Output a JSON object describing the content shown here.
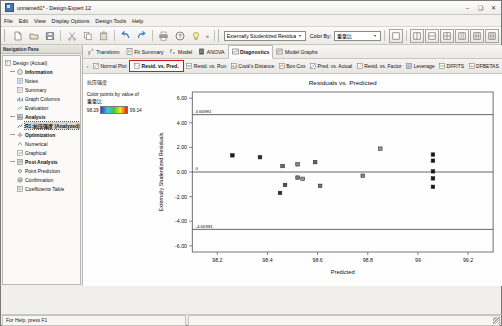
{
  "window": {
    "title": "unnamed1* - Design-Expert 12",
    "app_icon": "design-expert-icon",
    "minimize": "–",
    "maximize": "❑",
    "close": "✕"
  },
  "menubar": {
    "items": [
      {
        "label": "File"
      },
      {
        "label": "Edit"
      },
      {
        "label": "View"
      },
      {
        "label": "Display Options"
      },
      {
        "label": "Design Tools"
      },
      {
        "label": "Help"
      }
    ]
  },
  "toolbar": {
    "buttons": [
      {
        "name": "new-icon",
        "glyph": "⬜"
      },
      {
        "name": "open-icon",
        "glyph": "Ὄ1"
      },
      {
        "name": "save-icon",
        "glyph": "Ὃe"
      },
      {
        "name": "cut-icon",
        "glyph": "✂"
      },
      {
        "name": "copy-icon",
        "glyph": "⧉"
      },
      {
        "name": "paste-icon",
        "glyph": "Ὄb"
      },
      {
        "name": "undo-icon",
        "glyph": "↶"
      },
      {
        "name": "redo-icon",
        "glyph": "↷"
      },
      {
        "name": "print-icon",
        "glyph": "὚8"
      },
      {
        "name": "help-icon",
        "glyph": "?"
      },
      {
        "name": "tip-icon",
        "glyph": "Ὂ1"
      }
    ],
    "overflow": "»",
    "response_select": {
      "value": "Externally Studentized Residuals",
      "arrow": "▾"
    },
    "color_by_label": "Color By:",
    "color_by_select": {
      "value": "重量比",
      "arrow": "▾"
    },
    "view_buttons": [
      {
        "name": "view-single-icon"
      },
      {
        "name": "view-two-up-icon"
      },
      {
        "name": "view-three-up-icon"
      },
      {
        "name": "view-grid-icon"
      },
      {
        "name": "view-four-icon"
      },
      {
        "name": "view-six-icon"
      },
      {
        "name": "view-eight-icon"
      }
    ]
  },
  "navpane": {
    "header": "Navigation Pane",
    "tree": [
      {
        "level": 0,
        "label": "Design (Actual)",
        "icon": "table-icon",
        "bold": false,
        "selected": false
      },
      {
        "level": 1,
        "label": "Information",
        "icon": "info-icon",
        "bold": true,
        "selected": false
      },
      {
        "level": 2,
        "label": "Notes",
        "icon": "notes-icon",
        "bold": false,
        "selected": false
      },
      {
        "level": 2,
        "label": "Summary",
        "icon": "summary-icon",
        "bold": false,
        "selected": false
      },
      {
        "level": 2,
        "label": "Graph Columns",
        "icon": "graph-columns-icon",
        "bold": false,
        "selected": false
      },
      {
        "level": 2,
        "label": "Evaluation",
        "icon": "evaluation-icon",
        "bold": false,
        "selected": false
      },
      {
        "level": 1,
        "label": "Analysis",
        "icon": "analysis-icon",
        "bold": true,
        "selected": false
      },
      {
        "level": 2,
        "label": "R1:抗压强度 (Analyzed)",
        "icon": "response-icon",
        "bold": true,
        "selected": true
      },
      {
        "level": 1,
        "label": "Optimization",
        "icon": "optimization-icon",
        "bold": true,
        "selected": false
      },
      {
        "level": 2,
        "label": "Numerical",
        "icon": "numerical-icon",
        "bold": false,
        "selected": false
      },
      {
        "level": 2,
        "label": "Graphical",
        "icon": "graphical-icon",
        "bold": false,
        "selected": false
      },
      {
        "level": 1,
        "label": "Post Analysis",
        "icon": "post-analysis-icon",
        "bold": true,
        "selected": false
      },
      {
        "level": 2,
        "label": "Point Prediction",
        "icon": "point-prediction-icon",
        "bold": false,
        "selected": false
      },
      {
        "level": 2,
        "label": "Confirmation",
        "icon": "confirmation-icon",
        "bold": false,
        "selected": false
      },
      {
        "level": 2,
        "label": "Coefficients Table",
        "icon": "coefficients-icon",
        "bold": false,
        "selected": false
      }
    ]
  },
  "analysis": {
    "tabs": [
      {
        "label": "Transform",
        "icon": "transform-icon",
        "active": false
      },
      {
        "label": "Fit Summary",
        "icon": "fit-summary-icon",
        "active": false
      },
      {
        "label": "Model",
        "icon": "model-icon",
        "active": false
      },
      {
        "label": "ANOVA",
        "icon": "anova-icon",
        "active": false
      },
      {
        "label": "Diagnostics",
        "icon": "diagnostics-icon",
        "active": true
      },
      {
        "label": "Model Graphs",
        "icon": "model-graphs-icon",
        "active": false
      }
    ],
    "subtabs": [
      {
        "label": "Normal Plot",
        "icon": "normal-plot-icon",
        "highlight": false
      },
      {
        "label": "Resid. vs. Pred.",
        "icon": "resid-pred-icon",
        "highlight": true
      },
      {
        "label": "Resid. vs. Run",
        "icon": "resid-run-icon",
        "highlight": false
      },
      {
        "label": "Cook's Distance",
        "icon": "cooks-distance-icon",
        "highlight": false
      },
      {
        "label": "Box-Cox",
        "icon": "box-cox-icon",
        "highlight": false
      },
      {
        "label": "Pred. vs. Actual",
        "icon": "pred-actual-icon",
        "highlight": false
      },
      {
        "label": "Resid. vs. Factor",
        "icon": "resid-factor-icon",
        "highlight": false
      },
      {
        "label": "Leverage",
        "icon": "leverage-icon",
        "highlight": false
      },
      {
        "label": "DFFITS",
        "icon": "dffits-icon",
        "highlight": false
      },
      {
        "label": "DFBETAS",
        "icon": "dfbetas-icon",
        "highlight": false
      }
    ],
    "subtab_overflow": "»",
    "subtab_prev": "‹"
  },
  "legend": {
    "response_name": "抗压强度",
    "color_points_label": "Color points by value of",
    "color_by_name": "重量比",
    "min": "98.29",
    "max": "99.14"
  },
  "statusbar": {
    "help_text": "For Help, press F1"
  },
  "chart_data": {
    "type": "scatter",
    "title": "Residuals vs. Predicted",
    "xlabel": "Predicted",
    "ylabel": "Externally Studentized Residuals",
    "xlim": [
      98.1,
      99.3
    ],
    "ylim": [
      -6.5,
      6.5
    ],
    "xticks": [
      "98.2",
      "98.4",
      "98.6",
      "98.8",
      "99",
      "99.2"
    ],
    "xtickvals": [
      98.2,
      98.4,
      98.6,
      98.8,
      99.0,
      99.2
    ],
    "yticks": [
      "6.00",
      "4.00",
      "2.00",
      "0.00",
      "-2.00",
      "-4.00",
      "-6.00"
    ],
    "ytickvals": [
      6,
      4,
      2,
      0,
      -2,
      -4,
      -6
    ],
    "grid": false,
    "reference_lines": [
      {
        "y": 4.66,
        "label": "4.66981",
        "style": "solid"
      },
      {
        "y": 0,
        "label": "0",
        "style": "solid"
      },
      {
        "y": -4.66,
        "label": "-4.66981",
        "style": "solid"
      }
    ],
    "points": [
      {
        "x": 98.26,
        "y": 1.35,
        "color": "#1a1a1a"
      },
      {
        "x": 98.37,
        "y": 1.2,
        "color": "#2b2b2b"
      },
      {
        "x": 98.46,
        "y": 0.48,
        "color": "#6e6e6e"
      },
      {
        "x": 98.52,
        "y": 0.62,
        "color": "#8c8c8c"
      },
      {
        "x": 98.59,
        "y": 0.8,
        "color": "#6a6a6a"
      },
      {
        "x": 98.52,
        "y": -0.45,
        "color": "#7a7a7a"
      },
      {
        "x": 98.54,
        "y": -0.55,
        "color": "#9a9a9a"
      },
      {
        "x": 98.47,
        "y": -1.05,
        "color": "#555555"
      },
      {
        "x": 98.45,
        "y": -1.7,
        "color": "#2f2f2f"
      },
      {
        "x": 98.61,
        "y": -1.12,
        "color": "#777777"
      },
      {
        "x": 98.78,
        "y": -0.3,
        "color": "#8a8a8a"
      },
      {
        "x": 98.85,
        "y": 1.9,
        "color": "#9b9b9b"
      },
      {
        "x": 99.06,
        "y": 1.42,
        "color": "#161616"
      },
      {
        "x": 99.06,
        "y": 0.92,
        "color": "#161616"
      },
      {
        "x": 99.06,
        "y": 0.05,
        "color": "#161616"
      },
      {
        "x": 99.06,
        "y": -0.52,
        "color": "#161616"
      },
      {
        "x": 99.06,
        "y": -1.2,
        "color": "#161616"
      }
    ]
  }
}
